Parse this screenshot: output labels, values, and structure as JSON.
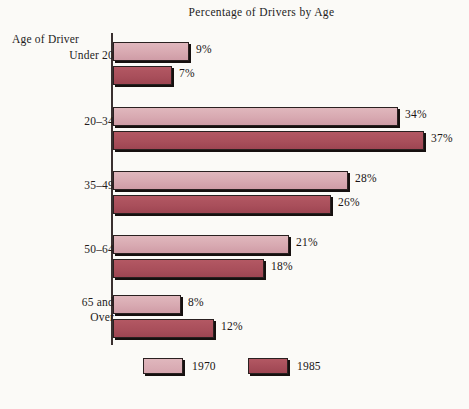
{
  "chart_data": {
    "type": "bar",
    "orientation": "horizontal",
    "title": "Percentage of Drivers by Age",
    "xlabel": "",
    "ylabel": "Age of Driver",
    "axis_caption": "Age of Driver",
    "categories": [
      "Under 20",
      "20–34",
      "35–49",
      "50–64",
      "65 and Over"
    ],
    "series": [
      {
        "name": "1970",
        "color": "#d8a9b1",
        "values": [
          9,
          34,
          28,
          21,
          8
        ],
        "value_labels": [
          "9%",
          "34%",
          "28%",
          "21%",
          "8%"
        ]
      },
      {
        "name": "1985",
        "color": "#a94f5b",
        "values": [
          7,
          37,
          26,
          18,
          12
        ],
        "value_labels": [
          "7%",
          "37%",
          "26%",
          "18%",
          "12%"
        ]
      }
    ],
    "xlim": [
      0,
      40
    ],
    "grid": false,
    "legend_position": "bottom"
  },
  "groups": [
    {
      "label": "Under 20",
      "label_lines": [
        "Under 20"
      ],
      "top": 12,
      "label_top": 18,
      "bars": [
        {
          "series": "1970",
          "value_label": "9%",
          "width": 76,
          "top": 12
        },
        {
          "series": "1985",
          "value_label": "7%",
          "width": 59,
          "top": 36
        }
      ]
    },
    {
      "label": "20–34",
      "label_lines": [
        "20–34"
      ],
      "top": 77,
      "label_top": 84,
      "bars": [
        {
          "series": "1970",
          "value_label": "34%",
          "width": 285,
          "top": 77
        },
        {
          "series": "1985",
          "value_label": "37%",
          "width": 311,
          "top": 101
        }
      ]
    },
    {
      "label": "35–49",
      "label_lines": [
        "35–49"
      ],
      "top": 141,
      "label_top": 148,
      "bars": [
        {
          "series": "1970",
          "value_label": "28%",
          "width": 235,
          "top": 141
        },
        {
          "series": "1985",
          "value_label": "26%",
          "width": 218,
          "top": 165
        }
      ]
    },
    {
      "label": "50–64",
      "label_lines": [
        "50–64"
      ],
      "top": 205,
      "label_top": 212,
      "bars": [
        {
          "series": "1970",
          "value_label": "21%",
          "width": 176,
          "top": 205
        },
        {
          "series": "1985",
          "value_label": "18%",
          "width": 151,
          "top": 229
        }
      ]
    },
    {
      "label": "65 and Over",
      "label_lines": [
        "65 and",
        "Over"
      ],
      "top": 265,
      "label_top": 265,
      "bars": [
        {
          "series": "1970",
          "value_label": "8%",
          "width": 68,
          "top": 265
        },
        {
          "series": "1985",
          "value_label": "12%",
          "width": 101,
          "top": 289
        }
      ]
    }
  ],
  "legend": {
    "items": [
      {
        "label": "1970",
        "color": "#d8a9b1"
      },
      {
        "label": "1985",
        "color": "#a94f5b"
      }
    ]
  }
}
